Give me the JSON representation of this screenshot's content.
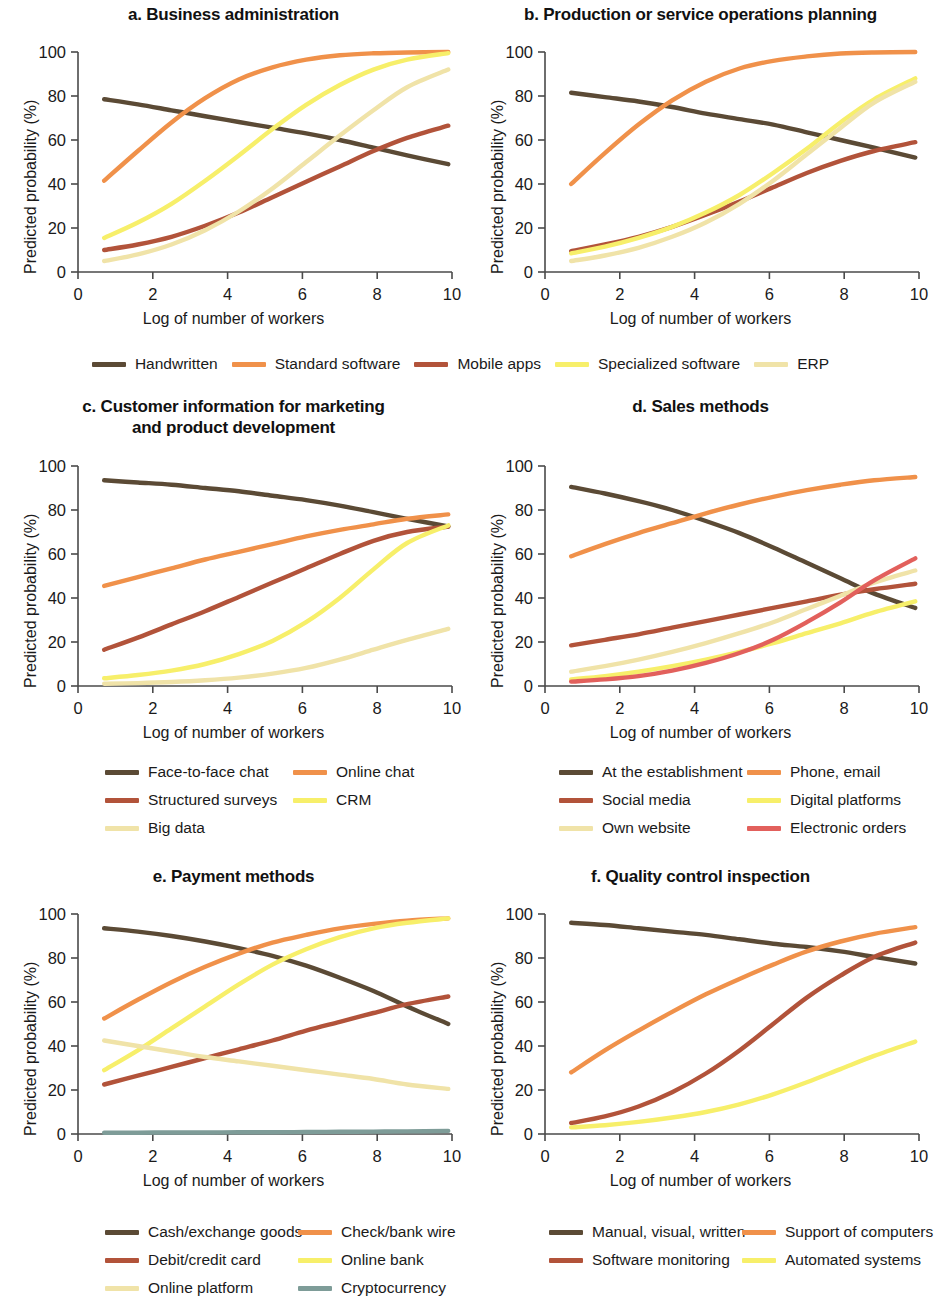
{
  "figure": {
    "axis_x_label": "Log of number of workers",
    "axis_y_label": "Predicted probability (%)",
    "x_ticks": [
      "0",
      "2",
      "4",
      "6",
      "8",
      "10"
    ],
    "y_ticks": [
      "0",
      "20",
      "40",
      "60",
      "80",
      "100"
    ]
  },
  "colors": {
    "dark_brown": "#5b4a35",
    "orange": "#f0914a",
    "rust": "#b2533a",
    "yellow": "#f7ef6a",
    "pale_yellow": "#f0e3a8",
    "red": "#e2605c",
    "teal": "#7e9c98"
  },
  "chart_data": [
    {
      "type": "line",
      "id": "a",
      "title": "a. Business administration",
      "xlabel": "Log of number of workers",
      "ylabel": "Predicted probability (%)",
      "xlim": [
        0,
        10
      ],
      "ylim": [
        0,
        100
      ],
      "xticks": [
        0,
        2,
        4,
        6,
        8,
        10
      ],
      "yticks": [
        0,
        20,
        40,
        60,
        80,
        100
      ],
      "grid": false,
      "legend_position": "below-shared",
      "x": [
        0.7,
        1.6,
        2.5,
        3.4,
        4.3,
        5.2,
        6.1,
        7.0,
        7.9,
        8.8,
        9.9
      ],
      "series": [
        {
          "name": "Handwritten",
          "color": "#5b4a35",
          "values": [
            78.5,
            76.2,
            73.5,
            70.8,
            68.2,
            65.6,
            63.0,
            60.0,
            56.5,
            53.0,
            49.0
          ]
        },
        {
          "name": "Standard software",
          "color": "#f0914a",
          "values": [
            41.5,
            55.0,
            68.0,
            79.0,
            87.5,
            93.0,
            96.5,
            98.5,
            99.4,
            99.8,
            100.0
          ]
        },
        {
          "name": "Mobile apps",
          "color": "#b2533a",
          "values": [
            10.0,
            12.5,
            16.0,
            21.0,
            27.0,
            34.0,
            41.0,
            48.0,
            55.0,
            61.0,
            66.5
          ]
        },
        {
          "name": "Specialized software",
          "color": "#f7ef6a",
          "values": [
            15.5,
            22.5,
            31.0,
            41.5,
            53.0,
            65.0,
            76.0,
            85.0,
            92.0,
            96.5,
            99.5
          ]
        },
        {
          "name": "ERP",
          "color": "#f0e3a8",
          "values": [
            5.0,
            8.0,
            12.5,
            19.0,
            27.5,
            38.0,
            50.0,
            62.0,
            73.5,
            84.0,
            92.0
          ]
        }
      ]
    },
    {
      "type": "line",
      "id": "b",
      "title": "b. Production or service operations planning",
      "xlabel": "Log of number of workers",
      "ylabel": "Predicted probability (%)",
      "xlim": [
        0,
        10
      ],
      "ylim": [
        0,
        100
      ],
      "xticks": [
        0,
        2,
        4,
        6,
        8,
        10
      ],
      "yticks": [
        0,
        20,
        40,
        60,
        80,
        100
      ],
      "grid": false,
      "legend_position": "below-shared",
      "x": [
        0.7,
        1.6,
        2.5,
        3.4,
        4.3,
        5.2,
        6.1,
        7.0,
        7.9,
        8.8,
        9.9
      ],
      "series": [
        {
          "name": "Handwritten",
          "color": "#5b4a35",
          "values": [
            81.5,
            79.5,
            77.5,
            75.0,
            72.0,
            69.5,
            67.0,
            63.5,
            60.0,
            56.5,
            52.0
          ]
        },
        {
          "name": "Standard software",
          "color": "#f0914a",
          "values": [
            40.0,
            54.0,
            67.0,
            78.0,
            86.5,
            92.5,
            96.0,
            98.0,
            99.3,
            99.8,
            100.0
          ]
        },
        {
          "name": "Mobile apps",
          "color": "#b2533a",
          "values": [
            9.5,
            12.5,
            16.0,
            20.5,
            26.0,
            32.0,
            38.5,
            45.0,
            50.5,
            55.0,
            59.0
          ]
        },
        {
          "name": "Specialized software",
          "color": "#f7ef6a",
          "values": [
            8.5,
            11.5,
            15.5,
            20.5,
            27.0,
            35.0,
            45.0,
            56.0,
            68.0,
            78.5,
            88.0
          ]
        },
        {
          "name": "ERP",
          "color": "#f0e3a8",
          "values": [
            5.0,
            7.5,
            11.0,
            16.0,
            22.5,
            31.0,
            41.5,
            53.5,
            65.5,
            77.0,
            86.5
          ]
        }
      ]
    },
    {
      "type": "line",
      "id": "c",
      "title": "c. Customer information for marketing and product development",
      "title_line1": "c. Customer information for marketing",
      "title_line2": "and product development",
      "xlabel": "Log of number of workers",
      "ylabel": "Predicted probability (%)",
      "xlim": [
        0,
        10
      ],
      "ylim": [
        0,
        100
      ],
      "xticks": [
        0,
        2,
        4,
        6,
        8,
        10
      ],
      "yticks": [
        0,
        20,
        40,
        60,
        80,
        100
      ],
      "grid": false,
      "legend_position": "below-shared",
      "x": [
        0.7,
        1.6,
        2.5,
        3.4,
        4.3,
        5.2,
        6.1,
        7.0,
        7.9,
        8.8,
        9.9
      ],
      "series": [
        {
          "name": "Face-to-face chat",
          "color": "#5b4a35",
          "values": [
            93.5,
            92.5,
            91.5,
            90.0,
            88.5,
            86.5,
            84.5,
            82.0,
            79.0,
            76.0,
            72.5
          ]
        },
        {
          "name": "Online chat",
          "color": "#f0914a",
          "values": [
            45.5,
            49.5,
            53.5,
            57.5,
            61.0,
            64.5,
            68.0,
            71.0,
            73.5,
            76.0,
            78.0
          ]
        },
        {
          "name": "Structured surveys",
          "color": "#b2533a",
          "values": [
            16.5,
            22.0,
            28.0,
            34.0,
            40.5,
            47.0,
            53.5,
            60.0,
            66.0,
            70.0,
            72.5
          ]
        },
        {
          "name": "CRM",
          "color": "#f7ef6a",
          "values": [
            3.5,
            5.0,
            7.0,
            10.0,
            14.5,
            20.5,
            29.0,
            40.0,
            53.0,
            65.0,
            73.0
          ]
        },
        {
          "name": "Big data",
          "color": "#f0e3a8",
          "values": [
            1.0,
            1.3,
            1.8,
            2.6,
            3.8,
            5.6,
            8.2,
            12.0,
            16.5,
            21.0,
            26.0
          ]
        }
      ]
    },
    {
      "type": "line",
      "id": "d",
      "title": "d. Sales methods",
      "xlabel": "Log of number of workers",
      "ylabel": "Predicted probability (%)",
      "xlim": [
        0,
        10
      ],
      "ylim": [
        0,
        100
      ],
      "xticks": [
        0,
        2,
        4,
        6,
        8,
        10
      ],
      "yticks": [
        0,
        20,
        40,
        60,
        80,
        100
      ],
      "grid": false,
      "legend_position": "below-shared",
      "x": [
        0.7,
        1.6,
        2.5,
        3.4,
        4.3,
        5.2,
        6.1,
        7.0,
        7.9,
        8.8,
        9.9
      ],
      "series": [
        {
          "name": "At the establishment",
          "color": "#5b4a35",
          "values": [
            90.5,
            87.5,
            84.0,
            80.0,
            75.0,
            69.5,
            63.0,
            56.0,
            49.0,
            42.0,
            35.5
          ]
        },
        {
          "name": "Phone, email",
          "color": "#f0914a",
          "values": [
            59.0,
            64.5,
            69.5,
            74.0,
            78.5,
            82.5,
            86.0,
            89.0,
            91.5,
            93.5,
            95.0
          ]
        },
        {
          "name": "Social media",
          "color": "#b2533a",
          "values": [
            18.5,
            21.0,
            23.5,
            26.5,
            29.5,
            32.5,
            35.5,
            38.5,
            41.5,
            44.0,
            46.5
          ]
        },
        {
          "name": "Digital platforms",
          "color": "#f7ef6a",
          "values": [
            3.0,
            4.5,
            6.5,
            9.0,
            12.0,
            15.5,
            19.5,
            24.0,
            28.5,
            33.5,
            38.5
          ]
        },
        {
          "name": "Own website",
          "color": "#f0e3a8",
          "values": [
            6.5,
            9.0,
            12.0,
            15.5,
            19.5,
            24.0,
            29.0,
            35.0,
            41.0,
            47.0,
            52.5
          ]
        },
        {
          "name": "Electronic orders",
          "color": "#e2605c",
          "values": [
            2.0,
            3.0,
            4.5,
            7.0,
            10.5,
            15.0,
            21.0,
            29.0,
            38.0,
            48.0,
            58.0
          ]
        }
      ]
    },
    {
      "type": "line",
      "id": "e",
      "title": "e. Payment methods",
      "xlabel": "Log of number of workers",
      "ylabel": "Predicted probability (%)",
      "xlim": [
        0,
        10
      ],
      "ylim": [
        0,
        100
      ],
      "xticks": [
        0,
        2,
        4,
        6,
        8,
        10
      ],
      "yticks": [
        0,
        20,
        40,
        60,
        80,
        100
      ],
      "grid": false,
      "legend_position": "below-shared",
      "x": [
        0.7,
        1.6,
        2.5,
        3.4,
        4.3,
        5.2,
        6.1,
        7.0,
        7.9,
        8.8,
        9.9
      ],
      "series": [
        {
          "name": "Cash/exchange goods",
          "color": "#5b4a35",
          "values": [
            93.5,
            92.0,
            90.0,
            87.5,
            84.5,
            81.0,
            76.5,
            71.0,
            65.0,
            58.0,
            50.0
          ]
        },
        {
          "name": "Check/bank wire",
          "color": "#f0914a",
          "values": [
            52.5,
            61.0,
            69.0,
            76.0,
            82.0,
            87.0,
            90.5,
            93.5,
            95.5,
            97.0,
            98.0
          ]
        },
        {
          "name": "Debit/credit card",
          "color": "#b2533a",
          "values": [
            22.5,
            26.5,
            30.5,
            34.5,
            38.5,
            42.5,
            47.0,
            51.0,
            55.0,
            59.0,
            62.5
          ]
        },
        {
          "name": "Online bank",
          "color": "#f7ef6a",
          "values": [
            29.0,
            38.0,
            48.0,
            58.0,
            68.0,
            77.0,
            84.0,
            89.5,
            93.5,
            96.0,
            98.0
          ]
        },
        {
          "name": "Online platform",
          "color": "#f0e3a8",
          "values": [
            42.5,
            40.0,
            37.5,
            35.0,
            33.0,
            31.0,
            29.0,
            27.0,
            25.0,
            22.5,
            20.5
          ]
        },
        {
          "name": "Cryptocurrency",
          "color": "#7e9c98",
          "values": [
            0.6,
            0.6,
            0.7,
            0.7,
            0.8,
            0.8,
            0.9,
            1.0,
            1.1,
            1.2,
            1.4
          ]
        }
      ]
    },
    {
      "type": "line",
      "id": "f",
      "title": "f. Quality control inspection",
      "xlabel": "Log of number of workers",
      "ylabel": "Predicted probability (%)",
      "xlim": [
        0,
        10
      ],
      "ylim": [
        0,
        100
      ],
      "xticks": [
        0,
        2,
        4,
        6,
        8,
        10
      ],
      "yticks": [
        0,
        20,
        40,
        60,
        80,
        100
      ],
      "grid": false,
      "legend_position": "below-shared",
      "x": [
        0.7,
        1.6,
        2.5,
        3.4,
        4.3,
        5.2,
        6.1,
        7.0,
        7.9,
        8.8,
        9.9
      ],
      "series": [
        {
          "name": "Manual, visual, written",
          "color": "#5b4a35",
          "values": [
            96.0,
            95.0,
            93.5,
            92.0,
            90.5,
            88.5,
            86.5,
            85.0,
            83.0,
            80.5,
            77.5
          ]
        },
        {
          "name": "Support of computers",
          "color": "#f0914a",
          "values": [
            28.0,
            38.0,
            47.0,
            55.5,
            63.5,
            70.5,
            77.0,
            83.0,
            87.5,
            91.0,
            94.0
          ]
        },
        {
          "name": "Software monitoring",
          "color": "#b2533a",
          "values": [
            5.0,
            8.0,
            12.5,
            19.0,
            27.5,
            38.0,
            50.0,
            62.0,
            72.0,
            80.5,
            87.0
          ]
        },
        {
          "name": "Automated systems",
          "color": "#f7ef6a",
          "values": [
            3.0,
            4.0,
            5.5,
            7.5,
            10.0,
            13.5,
            18.0,
            23.5,
            29.5,
            35.5,
            42.0
          ]
        }
      ]
    }
  ],
  "legends": {
    "ab": [
      {
        "label": "Handwritten",
        "color": "#5b4a35"
      },
      {
        "label": "Standard software",
        "color": "#f0914a"
      },
      {
        "label": "Mobile apps",
        "color": "#b2533a"
      },
      {
        "label": "Specialized software",
        "color": "#f7ef6a"
      },
      {
        "label": "ERP",
        "color": "#f0e3a8"
      }
    ],
    "c": [
      {
        "label": "Face-to-face chat",
        "color": "#5b4a35"
      },
      {
        "label": "Online chat",
        "color": "#f0914a"
      },
      {
        "label": "Structured surveys",
        "color": "#b2533a"
      },
      {
        "label": "CRM",
        "color": "#f7ef6a"
      },
      {
        "label": "Big data",
        "color": "#f0e3a8"
      }
    ],
    "d": [
      {
        "label": "At the establishment",
        "color": "#5b4a35"
      },
      {
        "label": "Phone, email",
        "color": "#f0914a"
      },
      {
        "label": "Social media",
        "color": "#b2533a"
      },
      {
        "label": "Digital platforms",
        "color": "#f7ef6a"
      },
      {
        "label": "Own website",
        "color": "#f0e3a8"
      },
      {
        "label": "Electronic orders",
        "color": "#e2605c"
      }
    ],
    "e": [
      {
        "label": "Cash/exchange goods",
        "color": "#5b4a35"
      },
      {
        "label": "Check/bank wire",
        "color": "#f0914a"
      },
      {
        "label": "Debit/credit card",
        "color": "#b2533a"
      },
      {
        "label": "Online bank",
        "color": "#f7ef6a"
      },
      {
        "label": "Online platform",
        "color": "#f0e3a8"
      },
      {
        "label": "Cryptocurrency",
        "color": "#7e9c98"
      }
    ],
    "f": [
      {
        "label": "Manual, visual, written",
        "color": "#5b4a35"
      },
      {
        "label": "Support of computers",
        "color": "#f0914a"
      },
      {
        "label": "Software monitoring",
        "color": "#b2533a"
      },
      {
        "label": "Automated systems",
        "color": "#f7ef6a"
      }
    ]
  }
}
